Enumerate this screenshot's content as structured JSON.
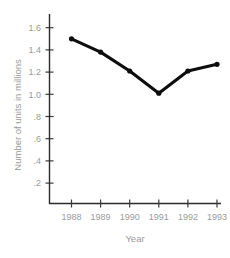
{
  "chart_data": {
    "type": "line",
    "title": "",
    "xlabel": "Year",
    "ylabel": "Number of units in millions",
    "categories": [
      "1988",
      "1989",
      "1990",
      "1991",
      "1992",
      "1993"
    ],
    "values": [
      1.5,
      1.38,
      1.21,
      1.01,
      1.21,
      1.27
    ],
    "series": [
      {
        "name": "Number of units in millions",
        "values": [
          1.5,
          1.38,
          1.21,
          1.01,
          1.21,
          1.27
        ]
      }
    ],
    "ylim": [
      0,
      1.7
    ],
    "xlim": [
      "1988",
      "1993"
    ],
    "ytick_labels": [
      ".2",
      ".4",
      ".6",
      ".8",
      "1.0",
      "1.2",
      "1.4",
      "1.6"
    ],
    "ytick_values": [
      0.2,
      0.4,
      0.6,
      0.8,
      1.0,
      1.2,
      1.4,
      1.6
    ],
    "xtick_labels": [
      "1988",
      "1989",
      "1990",
      "1991",
      "1992",
      "1993"
    ],
    "grid": false,
    "legend": false,
    "line_color": "#0d0d0d",
    "marker_color": "#0d0d0d",
    "axis_color": "#2b2b2b",
    "label_color": "#9a9a9a",
    "background_color": "#ffffff"
  },
  "axis": {
    "x_title": "Year",
    "y_title": "Number of units in millions"
  }
}
